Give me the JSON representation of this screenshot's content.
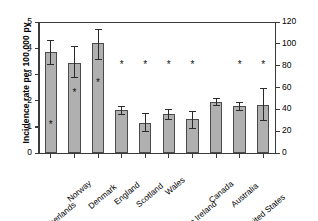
{
  "chart_data": {
    "type": "bar",
    "title": "",
    "categories": [
      "The Netherlands",
      "Norway",
      "Denmark",
      "England",
      "Scotland",
      "Wales",
      "Northern Ireland",
      "Canada",
      "Australia",
      "United States"
    ],
    "values": [
      3.85,
      3.45,
      4.2,
      1.65,
      1.15,
      1.5,
      1.3,
      1.95,
      1.8,
      1.85
    ],
    "error_low": [
      3.4,
      2.9,
      3.6,
      1.5,
      0.85,
      1.3,
      0.95,
      1.85,
      1.65,
      1.25
    ],
    "error_high": [
      4.3,
      4.1,
      4.75,
      1.8,
      1.55,
      1.7,
      1.6,
      2.1,
      1.95,
      2.5
    ],
    "ab_prescription_rate": [
      26,
      55,
      64,
      81,
      81,
      81,
      81,
      null,
      81,
      81
    ],
    "ab_marker": "*",
    "ylabel": "Incidence rate per 100,000 py",
    "ylabel_right": "* ab prescription rate (%)",
    "xlabel": "",
    "ylim": [
      0,
      5
    ],
    "ylim_right": [
      0,
      120
    ],
    "yticks": [
      "0",
      "1",
      "2",
      "3",
      "4",
      "5"
    ],
    "yticks_right": [
      "0",
      "20",
      "40",
      "60",
      "80",
      "100",
      "120"
    ],
    "grid": false,
    "legend": "none",
    "bar_color": "#b0b0b0",
    "bar_edge_color": "#4a4a4a",
    "error_color": "#2b2b2b"
  }
}
